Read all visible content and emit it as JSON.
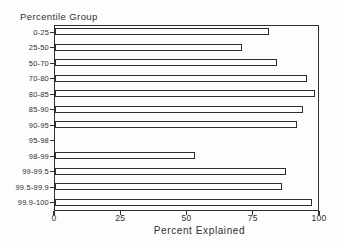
{
  "chart_data": {
    "type": "bar",
    "orientation": "horizontal",
    "title": "Percentile Group",
    "xlabel": "Percent Explained",
    "categories": [
      "0-25",
      "25-50",
      "50-70",
      "70-80",
      "80-85",
      "85-90",
      "90-95",
      "95-98",
      "98-99",
      "99-99.5",
      "99.5-99.9",
      "99.9-100"
    ],
    "values": [
      81,
      71,
      84,
      95.5,
      98.5,
      94,
      91.5,
      0,
      53,
      87.5,
      86,
      97.5
    ],
    "x_ticks": [
      0,
      25,
      50,
      75,
      100
    ],
    "xlim": [
      0,
      100
    ],
    "grid": false,
    "legend": "none",
    "note": "The 95-98 percentile group row has no bar drawn (zero/missing value); bars are white with dark outline on a framed plot box."
  },
  "colors": {
    "line": "#2f2f2f",
    "background": "#fdfdfd",
    "bar_fill": "#ffffff"
  }
}
